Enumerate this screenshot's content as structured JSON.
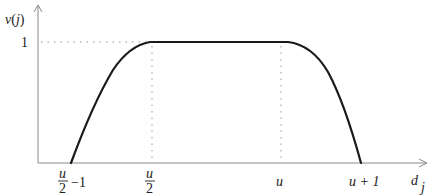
{
  "diagram": {
    "y_axis_label": "v(j)",
    "x_axis_label": "d_j",
    "y_tick": "1",
    "x_ticks": [
      {
        "num": "u",
        "den": "2",
        "suffix": "−1"
      },
      {
        "num": "u",
        "den": "2",
        "suffix": ""
      },
      {
        "text": "u"
      },
      {
        "text": "u + 1"
      }
    ],
    "x_label_main": "d",
    "x_label_sub": "j",
    "y_label_v": "v",
    "y_label_j": "j",
    "colors": {
      "curve": "#1a1a1a",
      "axis": "#8a8a8a",
      "guides": "#b8b8b8"
    }
  }
}
